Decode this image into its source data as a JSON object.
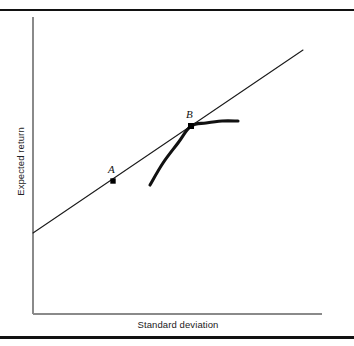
{
  "figure": {
    "title": "",
    "x_axis_label": "Standard deviation",
    "y_axis_label": "Expected return",
    "point_a_label": "A",
    "point_b_label": "B",
    "colors": {
      "axis": "#8a8a8a",
      "line": "#1a1a1a",
      "curve": "#111111",
      "marker": "#000000",
      "rule": "#121212",
      "background": "#ffffff"
    }
  },
  "chart_data": {
    "type": "line",
    "title": "",
    "xlabel": "Standard deviation",
    "ylabel": "Expected return",
    "xlim": [
      0,
      1
    ],
    "ylim": [
      0,
      1
    ],
    "grid": false,
    "legend": null,
    "axes_ticks": {
      "x": [],
      "y": []
    },
    "series": [
      {
        "name": "Capital market line",
        "type": "line",
        "style": "thin-straight",
        "points_px": [
          [
            33,
            233
          ],
          [
            303,
            50
          ]
        ],
        "description": "Straight upward-sloping line from the vertical axis intercept to the upper right, passing through points A and B"
      },
      {
        "name": "Efficient frontier",
        "type": "curve",
        "style": "thick-concave",
        "points_px": [
          [
            150,
            185
          ],
          [
            163,
            163
          ],
          [
            178,
            143
          ],
          [
            191,
            126
          ],
          [
            206,
            123
          ],
          [
            222,
            121
          ],
          [
            238,
            121
          ]
        ],
        "description": "Thick concave curve rising from lower left, tangent to the straight line at point B, flattening to the right"
      }
    ],
    "annotations": [
      {
        "label": "A",
        "point_px": [
          113,
          181
        ],
        "label_px": [
          108,
          170
        ],
        "marker": "filled-square",
        "on": "Capital market line"
      },
      {
        "label": "B",
        "point_px": [
          191,
          126
        ],
        "label_px": [
          186,
          115
        ],
        "marker": "filled-square",
        "on": "tangency of Capital market line and Efficient frontier"
      }
    ]
  }
}
